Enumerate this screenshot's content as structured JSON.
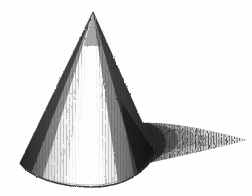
{
  "artwork": {
    "title": "Cone with cast shadow",
    "medium": "graphite pencil sketch on white paper",
    "subject_name": "cone",
    "description": "A hand-drawn cone rendered with vertical pencil hatching, a vertical highlight band on the lit face, dense dark shading on the right flank, and a long cast shadow tapering to the right edge.",
    "alt_text": "Pencil drawing of a cone lit from the left, casting a tapering hatched shadow toward the right",
    "canvas": {
      "width": 252,
      "height": 196,
      "background_color": "#ffffff"
    },
    "palette": {
      "paper": "#ffffff",
      "light_graphite": "#c8c8c8",
      "mid_graphite": "#8a8a8a",
      "dark_graphite": "#4a4a4a",
      "darkest_graphite": "#1a1a1a"
    },
    "geometry": {
      "apex": {
        "x": 93,
        "y": 12
      },
      "base_left": {
        "x": 20,
        "y": 163
      },
      "base_right": {
        "x": 155,
        "y": 152
      },
      "base_bottom": {
        "x": 92,
        "y": 186
      },
      "shadow_tip": {
        "x": 247,
        "y": 142
      }
    },
    "elements": [
      {
        "name": "cone-body",
        "label": "Cone body"
      },
      {
        "name": "cone-highlight",
        "label": "Highlight band"
      },
      {
        "name": "cone-left-shading",
        "label": "Left edge shading"
      },
      {
        "name": "cone-right-shading",
        "label": "Right flank shading"
      },
      {
        "name": "cone-base-ellipse",
        "label": "Base ellipse"
      },
      {
        "name": "cast-shadow",
        "label": "Cast shadow"
      }
    ],
    "hatching": {
      "style": "vertical strokes",
      "cone_stroke_count": 86,
      "shadow_stroke_count": 74
    }
  }
}
